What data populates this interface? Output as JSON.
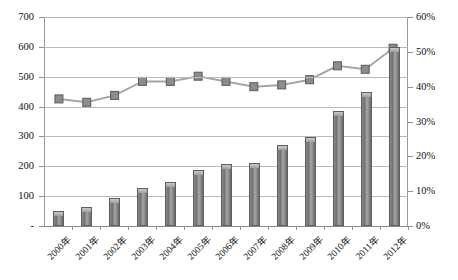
{
  "chart_data": {
    "type": "bar",
    "title": "",
    "subtitle": "",
    "xlabel": "",
    "ylabel": "",
    "grid": true,
    "legend": "none",
    "categories": [
      "2000年",
      "2001年",
      "2002年",
      "2003年",
      "2004年",
      "2005年",
      "2006年",
      "2007年",
      "2008年",
      "2009年",
      "2010年",
      "2011年",
      "2012年"
    ],
    "series": [
      {
        "name": "bars",
        "type": "bar",
        "axis": "left",
        "values": [
          50,
          65,
          95,
          127,
          147,
          187,
          208,
          210,
          270,
          297,
          385,
          450,
          600
        ]
      },
      {
        "name": "line",
        "type": "line",
        "axis": "right",
        "values": [
          36.5,
          35.5,
          37.5,
          41.5,
          41.5,
          43.0,
          41.5,
          40.0,
          40.5,
          42.0,
          46.0,
          45.0,
          51.0
        ]
      }
    ],
    "ylim": [
      0,
      700
    ],
    "y2lim": [
      0,
      60
    ],
    "yticks": [
      "-",
      "100",
      "200",
      "300",
      "400",
      "500",
      "600",
      "700"
    ],
    "ytick_values": [
      0,
      100,
      200,
      300,
      400,
      500,
      600,
      700
    ],
    "y2ticks": [
      "0%",
      "10%",
      "20%",
      "30%",
      "40%",
      "50%",
      "60%"
    ],
    "y2tick_values": [
      0,
      10,
      20,
      30,
      40,
      50,
      60
    ],
    "colors": {
      "bar_fill": "#7f7f7f",
      "bar_edge": "#5d5d5d",
      "line": "#a6a6a6",
      "marker_fill": "#8c8c8c",
      "marker_edge": "#595959",
      "grid": "#b9b9b9",
      "axis": "#8f8f8f",
      "background": "#ffffff"
    }
  }
}
